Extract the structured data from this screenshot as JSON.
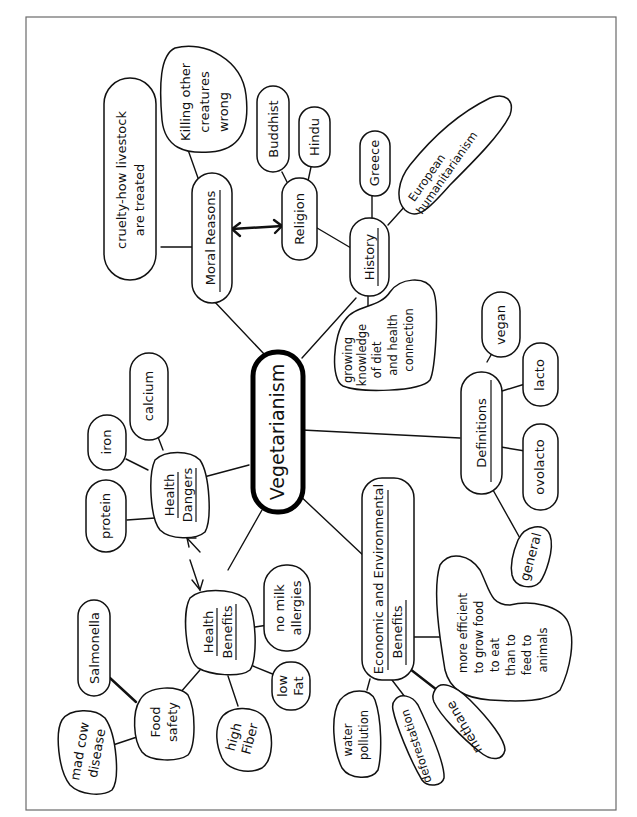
{
  "diagram": {
    "type": "mind map",
    "orientation": "rotated 90 degrees counter-clockwise (text reads bottom-to-top)",
    "center": {
      "label": "Vegetarianism"
    },
    "branches": {
      "moral_reasons": {
        "label": "Moral Reasons",
        "children": [
          "cruelty-how livestock are treated",
          "Killing other creatures wrong"
        ],
        "linked_to": "Religion"
      },
      "religion": {
        "label": "Religion",
        "children": [
          "Buddhist",
          "Hindu"
        ]
      },
      "history": {
        "label": "History",
        "children": [
          "Greece",
          "European humanitarianism",
          "growing knowledge of diet and health connection"
        ]
      },
      "definitions": {
        "label": "Definitions",
        "children": [
          "vegan",
          "lacto",
          "ovolacto",
          "general"
        ]
      },
      "economic": {
        "label_line1": "Economic and Environmental",
        "label_line2": "Benefits",
        "children": [
          "water pollution",
          "deforestation",
          "methane",
          "more efficient to grow food to eat than to feed to animals"
        ]
      },
      "health_benefits": {
        "label_line1": "Health",
        "label_line2": "Benefits",
        "children": [
          "no milk allergies",
          "low fat",
          "high fiber",
          "Food safety"
        ],
        "linked_to": "Health Dangers"
      },
      "food_safety": {
        "label_line1": "Food",
        "label_line2": "safety",
        "children": [
          "Salmonella",
          "mad cow disease"
        ]
      },
      "health_dangers": {
        "label_line1": "Health",
        "label_line2": "Dangers",
        "children": [
          "protein",
          "iron",
          "calcium"
        ]
      }
    },
    "leaf_labels": {
      "cruelty_1": "cruelty-how livestock",
      "cruelty_2": "are treated",
      "killing_1": "Killing other",
      "killing_2": "creatures",
      "killing_3": "wrong",
      "buddhist": "Buddhist",
      "hindu": "Hindu",
      "greece": "Greece",
      "european_1": "European",
      "european_2": "humanitarianism",
      "growing_1": "growing",
      "growing_2": "knowledge",
      "growing_3": "of diet",
      "growing_4": "and health",
      "growing_5": "connection",
      "vegan": "vegan",
      "lacto": "lacto",
      "ovolacto": "ovolacto",
      "general": "general",
      "efficient_1": "more efficient",
      "efficient_2": "to grow food",
      "efficient_3": "to eat",
      "efficient_4": "than to",
      "efficient_5": "feed to",
      "efficient_6": "animals",
      "methane": "methane",
      "deforestation": "deforestation",
      "water_1": "water",
      "water_2": "pollution",
      "no_milk_1": "no milk",
      "no_milk_2": "allergies",
      "low_fat_1": "low",
      "low_fat_2": "Fat",
      "high_fiber_1": "high",
      "high_fiber_2": "Fiber",
      "salmonella": "Salmonella",
      "mad_cow_1": "mad cow",
      "mad_cow_2": "disease",
      "protein": "protein",
      "iron": "iron",
      "calcium": "calcium"
    }
  }
}
